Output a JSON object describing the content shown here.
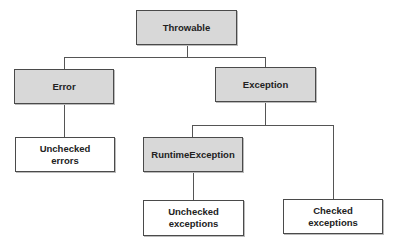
{
  "diagram": {
    "colors": {
      "class_fill": "#d8d8d8",
      "category_fill": "#ffffff",
      "border": "#4a4a4a",
      "text": "#222222"
    },
    "nodes": [
      {
        "id": "throwable",
        "label": "Throwable",
        "style": "gray",
        "parent": null
      },
      {
        "id": "error",
        "label": "Error",
        "style": "gray",
        "parent": "throwable"
      },
      {
        "id": "exception",
        "label": "Exception",
        "style": "gray",
        "parent": "throwable"
      },
      {
        "id": "unchecked_errors",
        "label": "Unchecked\nerrors",
        "style": "white",
        "parent": "error"
      },
      {
        "id": "runtime_exception",
        "label": "RuntimeException",
        "style": "gray",
        "parent": "exception"
      },
      {
        "id": "unchecked_exceptions",
        "label": "Unchecked\nexceptions",
        "style": "white",
        "parent": "runtime_exception"
      },
      {
        "id": "checked_exceptions",
        "label": "Checked\nexceptions",
        "style": "white",
        "parent": "exception"
      }
    ]
  }
}
